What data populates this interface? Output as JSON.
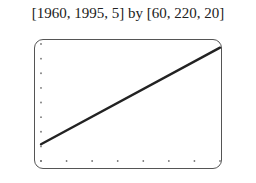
{
  "caption": "[1960, 1995, 5] by [60, 220, 20]",
  "chart_data": {
    "type": "line",
    "title": "[1960, 1995, 5] by [60, 220, 20]",
    "xlabel": "",
    "ylabel": "",
    "xlim": [
      1960,
      1995
    ],
    "xscale": 5,
    "ylim": [
      60,
      220
    ],
    "yscale": 20,
    "grid": false,
    "tick_style": "dots",
    "series": [
      {
        "name": "line",
        "x": [
          1960,
          1995
        ],
        "y": [
          83,
          215
        ]
      }
    ]
  }
}
